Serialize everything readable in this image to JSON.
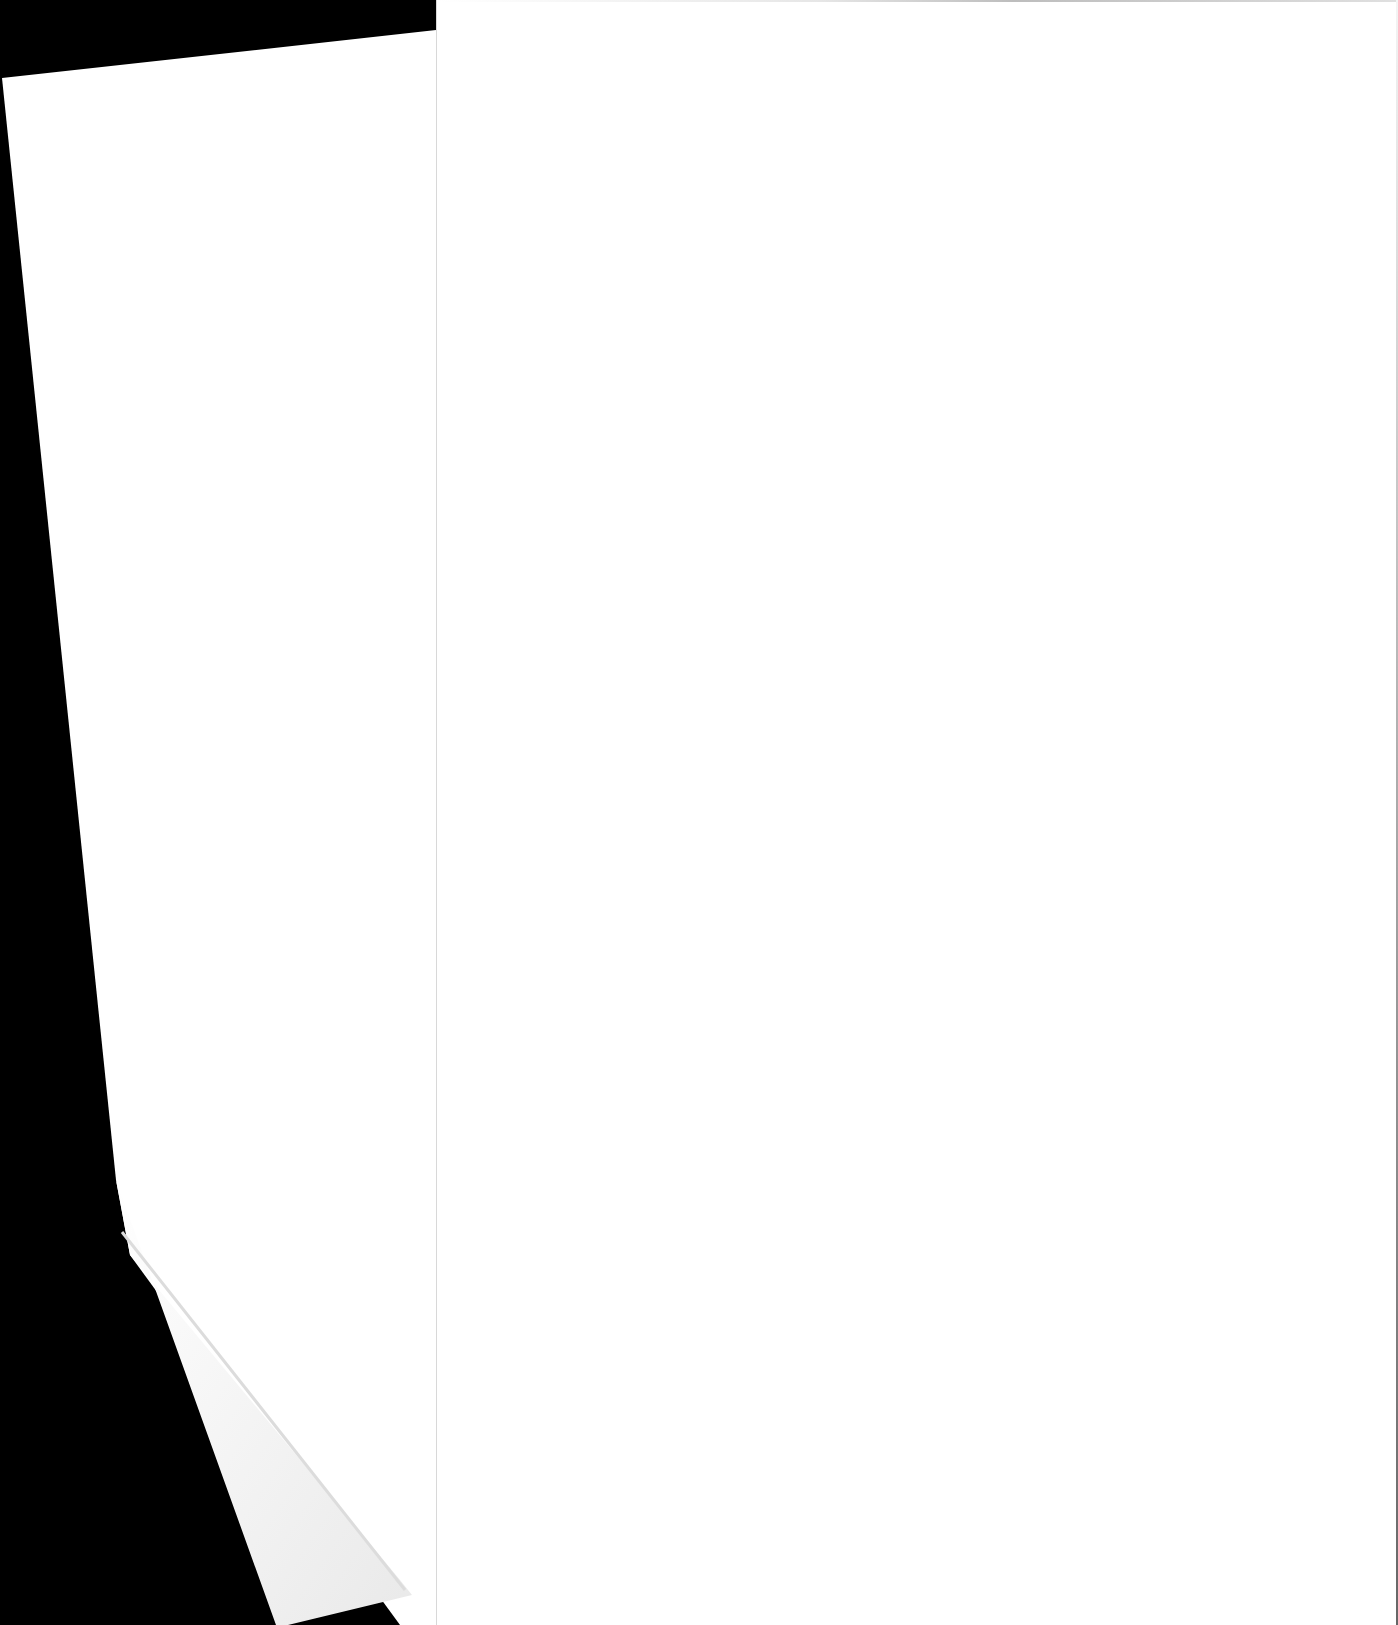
{
  "scene": {
    "type": "scanned-blank-pages",
    "background_color": "#000000",
    "paper_color": "#ffffff",
    "visible_text": ""
  },
  "left_sheet": {
    "visible_text": "",
    "folded_corner": true
  },
  "right_page": {
    "visible_text": ""
  }
}
